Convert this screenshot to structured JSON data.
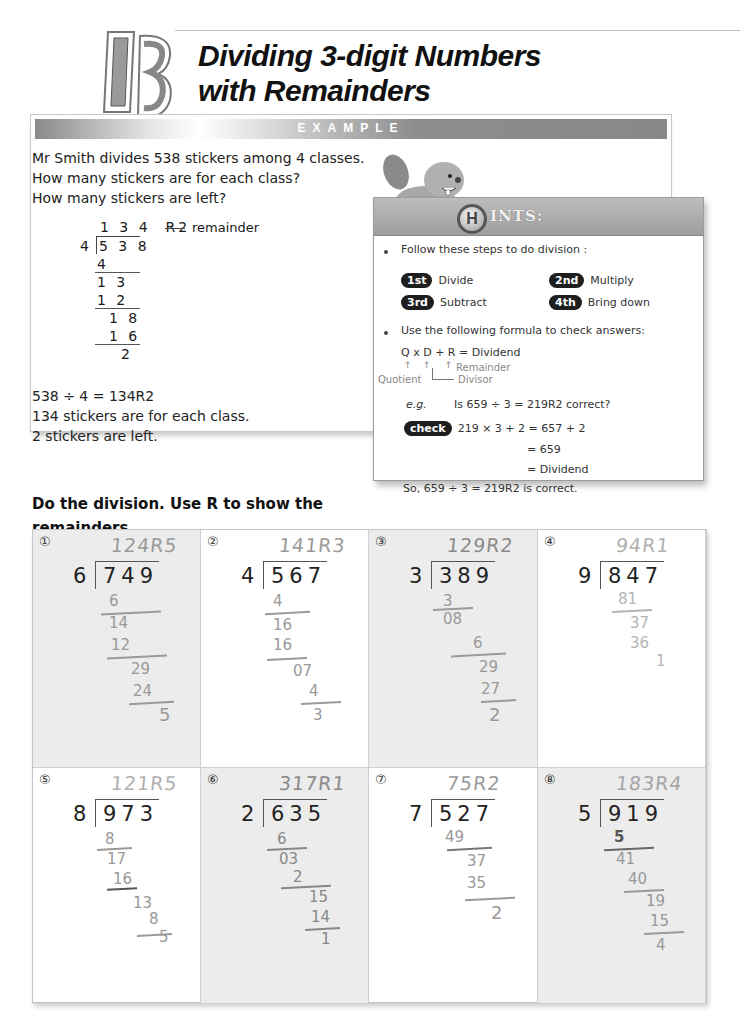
{
  "header": {
    "lesson_number": "13",
    "title_line1": "Dividing 3-digit Numbers",
    "title_line2": "with Remainders"
  },
  "example": {
    "banner": "EXAMPLE",
    "problem_lines": [
      "Mr Smith divides 538 stickers among 4 classes.",
      "How many stickers are for each class?",
      "How  many stickers are left?"
    ],
    "long_division": {
      "quotient": "1 3 4  R2",
      "remainder_label": "remainder",
      "divisor": "4",
      "dividend": "5 3 8",
      "steps": [
        "4",
        "1 3",
        "1 2",
        "1 8",
        "1 6",
        "2"
      ]
    },
    "answer_lines": [
      "538 ÷ 4 = 134R2",
      "134 stickers are for each class.",
      "2 stickers are left."
    ]
  },
  "hints": {
    "logo_letter": "H",
    "title": "INTS:",
    "bullet1": "Follow these steps to do division :",
    "steps": [
      {
        "badge": "1st",
        "label": "Divide"
      },
      {
        "badge": "2nd",
        "label": "Multiply"
      },
      {
        "badge": "3rd",
        "label": "Subtract"
      },
      {
        "badge": "4th",
        "label": "Bring down"
      }
    ],
    "bullet2": "Use the following formula to check answers:",
    "formula": "Q x D + R = Dividend",
    "formula_labels": {
      "remainder": "Remainder",
      "quotient": "Quotient",
      "divisor": "Divisor"
    },
    "eg_label": "e.g.",
    "eg_question": "Is 659 ÷ 3  = 219R2 correct?",
    "check_badge": "check",
    "check_line1": "219 × 3 + 2  = 657 + 2",
    "check_line2": "= 659",
    "check_line3": "= Dividend",
    "conclusion": "So, 659 ÷ 3 = 219R2 is correct."
  },
  "instruction": "Do the division.  Use R to show the remainders.",
  "problems": [
    {
      "number": "①",
      "divisor": "6",
      "dividend": "749",
      "handwritten_answer": "124R5",
      "work": [
        "6",
        "14",
        "12",
        "29",
        "24",
        "5"
      ]
    },
    {
      "number": "②",
      "divisor": "4",
      "dividend": "567",
      "handwritten_answer": "141R3",
      "work": [
        "4",
        "16",
        "16",
        "07",
        "4",
        "3"
      ]
    },
    {
      "number": "③",
      "divisor": "3",
      "dividend": "389",
      "handwritten_answer": "129R2",
      "work": [
        "3",
        "08",
        "6",
        "29",
        "27",
        "2"
      ]
    },
    {
      "number": "④",
      "divisor": "9",
      "dividend": "847",
      "handwritten_answer": "94R1",
      "work": [
        "81",
        "37",
        "36",
        "1"
      ]
    },
    {
      "number": "⑤",
      "divisor": "8",
      "dividend": "973",
      "handwritten_answer": "121R5",
      "work": [
        "8",
        "17",
        "16",
        "13",
        "8",
        "5"
      ]
    },
    {
      "number": "⑥",
      "divisor": "2",
      "dividend": "635",
      "handwritten_answer": "317R1",
      "work": [
        "6",
        "03",
        "2",
        "15",
        "14",
        "1"
      ]
    },
    {
      "number": "⑦",
      "divisor": "7",
      "dividend": "527",
      "handwritten_answer": "75R2",
      "work": [
        "49",
        "37",
        "35",
        "2"
      ]
    },
    {
      "number": "⑧",
      "divisor": "5",
      "dividend": "919",
      "handwritten_answer": "183R4",
      "work": [
        "5",
        "41",
        "40",
        "19",
        "15",
        "4"
      ]
    }
  ],
  "colors": {
    "banner_gray": "#8d8d8d",
    "shaded_cell": "#ececec",
    "handwriting": "#9a9a9a",
    "badge_black": "#1e1e1e"
  }
}
